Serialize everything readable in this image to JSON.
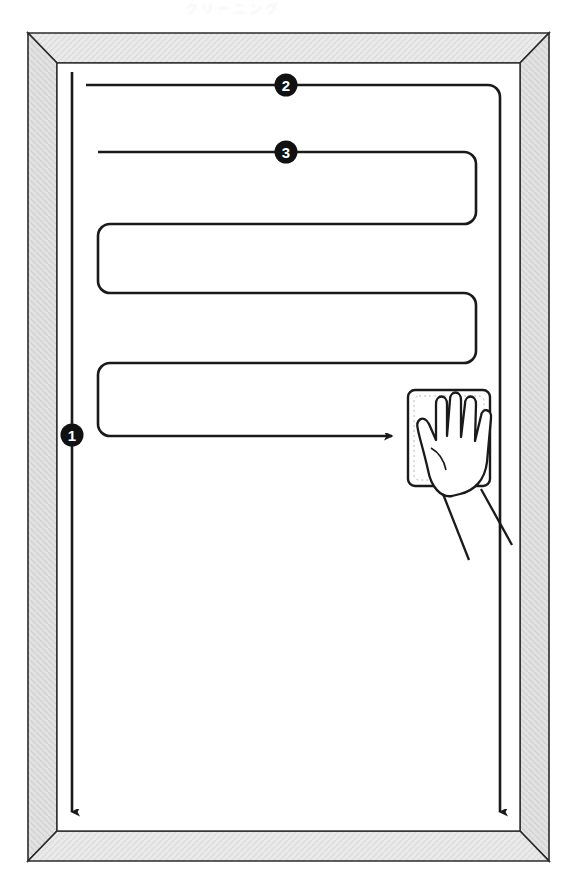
{
  "page": {
    "domain": "Diagram",
    "kind": "instructional-line-diagram",
    "title_cutoff": "クリーニング",
    "background_color": "#ffffff",
    "ink_color": "#1a1a1a",
    "frame_fill": "#e9e9e9",
    "frame_fill_dark": "#d8d8d8",
    "frame_edge": "#2b2b2b"
  },
  "frame": {
    "name": "window-panel-frame",
    "outer": {
      "x": 28,
      "y": 33,
      "width": 521,
      "height": 828
    },
    "inner": {
      "x": 57,
      "y": 63,
      "width": 463,
      "height": 768
    },
    "style": "mitered-corner-bevel",
    "texture": "fine-hatched-gray"
  },
  "markers": [
    {
      "id": "marker-1",
      "label": "1",
      "x": 72,
      "y": 435,
      "on": "left-vertical-stroke"
    },
    {
      "id": "marker-2",
      "label": "2",
      "x": 286,
      "y": 85,
      "on": "top-horizontal-stroke"
    },
    {
      "id": "marker-3",
      "label": "3",
      "x": 286,
      "y": 152,
      "on": "second-horizontal-stroke"
    }
  ],
  "strokes": {
    "left_vertical": {
      "name": "stroke-1-vertical-down-left",
      "x": 72,
      "y_start": 72,
      "y_end": 820,
      "arrow": "down"
    },
    "right_vertical": {
      "name": "stroke-2-vertical-down-right",
      "x": 500,
      "y_start": 96,
      "y_end": 820,
      "arrow": "down"
    },
    "top_horizontal": {
      "name": "stroke-2-horizontal-right",
      "x_start": 86,
      "x_end": 500,
      "y": 85
    },
    "serpentine": {
      "name": "stroke-3-serpentine-wipe-path",
      "corner_radius": 12,
      "rows": [
        {
          "y": 152,
          "x_start": 98,
          "x_end": 476,
          "direction": "right"
        },
        {
          "y": 224,
          "x_start": 476,
          "x_end": 98,
          "direction": "left"
        },
        {
          "y": 293,
          "x_start": 98,
          "x_end": 476,
          "direction": "right"
        },
        {
          "y": 363,
          "x_start": 476,
          "x_end": 98,
          "direction": "left"
        },
        {
          "y": 436,
          "x_start": 98,
          "x_end": 400,
          "direction": "right",
          "arrow": "right"
        }
      ]
    }
  },
  "hand": {
    "name": "hand-with-cloth",
    "cloth": {
      "x": 408,
      "y": 390,
      "width": 82,
      "height": 96,
      "radius": 7
    },
    "description": "hand pressing a folded cloth against the pane, wrist extending to lower right",
    "arrow_target": {
      "x": 400,
      "y": 436
    }
  }
}
